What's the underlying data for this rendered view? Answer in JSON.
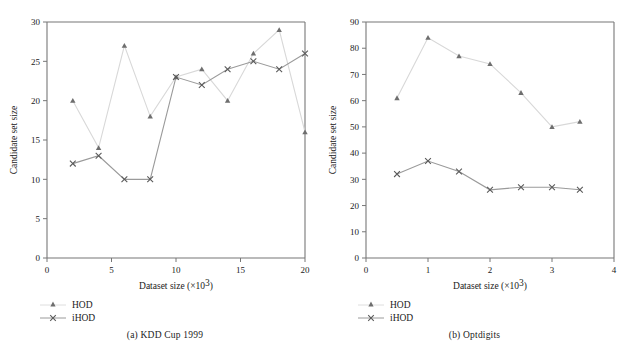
{
  "figure": {
    "background": "#ffffff",
    "series_colors": {
      "HOD": "#d8d8d8",
      "iHOD": "#9a9a9a"
    },
    "marker_color": "#6e6e6e",
    "axis_color": "#777777"
  },
  "panels": [
    {
      "id": "a",
      "caption": "(a)  KDD Cup 1999",
      "legend": [
        {
          "label": "HOD",
          "marker": "triangle-marker",
          "color": "#d8d8d8"
        },
        {
          "label": "iHOD",
          "marker": "cross-marker",
          "color": "#9a9a9a"
        }
      ]
    },
    {
      "id": "b",
      "caption": "(b)  Optdigits",
      "legend": [
        {
          "label": "HOD",
          "marker": "triangle-marker",
          "color": "#d8d8d8"
        },
        {
          "label": "iHOD",
          "marker": "cross-marker",
          "color": "#9a9a9a"
        }
      ]
    }
  ],
  "chart_data": [
    {
      "type": "line",
      "panel": "a",
      "title": "(a)  KDD Cup 1999",
      "xlabel": "Dataset size (×10³)",
      "ylabel": "Candidate set size",
      "xlim": [
        0,
        20
      ],
      "ylim": [
        0,
        30
      ],
      "xticks": [
        0,
        5,
        10,
        15,
        20
      ],
      "yticks": [
        0,
        5,
        10,
        15,
        20,
        25,
        30
      ],
      "grid": false,
      "legend_position": "below-left",
      "x": [
        2,
        4,
        6,
        8,
        10,
        12,
        14,
        16,
        18,
        20
      ],
      "series": [
        {
          "name": "HOD",
          "marker": "triangle",
          "values": [
            20,
            14,
            27,
            18,
            23,
            24,
            20,
            26,
            29,
            16
          ]
        },
        {
          "name": "iHOD",
          "marker": "cross",
          "values": [
            12,
            13,
            10,
            10,
            23,
            22,
            24,
            25,
            24,
            26
          ]
        }
      ]
    },
    {
      "type": "line",
      "panel": "b",
      "title": "(b)  Optdigits",
      "xlabel": "Dataset size (×10³)",
      "ylabel": "Candidate set size",
      "xlim": [
        0,
        4
      ],
      "ylim": [
        0,
        90
      ],
      "xticks": [
        0,
        1,
        2,
        3,
        4
      ],
      "yticks": [
        0,
        10,
        20,
        30,
        40,
        50,
        60,
        70,
        80,
        90
      ],
      "grid": false,
      "legend_position": "below-left",
      "x": [
        0.5,
        1.0,
        1.5,
        2.0,
        2.5,
        3.0,
        3.45
      ],
      "series": [
        {
          "name": "HOD",
          "marker": "triangle",
          "values": [
            61,
            84,
            77,
            74,
            63,
            50,
            52
          ]
        },
        {
          "name": "iHOD",
          "marker": "cross",
          "values": [
            32,
            37,
            33,
            26,
            27,
            27,
            26
          ]
        }
      ]
    }
  ],
  "axis_text": {
    "xlabel_main": "Dataset size (×10",
    "xlabel_sup": "3",
    "xlabel_close": ")",
    "ylabel": "Candidate set size"
  },
  "ticks": {
    "a_x": [
      "0",
      "5",
      "10",
      "15",
      "20"
    ],
    "a_y": [
      "0",
      "5",
      "10",
      "15",
      "20",
      "25",
      "30"
    ],
    "b_x": [
      "0",
      "1",
      "2",
      "3",
      "4"
    ],
    "b_y": [
      "0",
      "10",
      "20",
      "30",
      "40",
      "50",
      "60",
      "70",
      "80",
      "90"
    ]
  }
}
